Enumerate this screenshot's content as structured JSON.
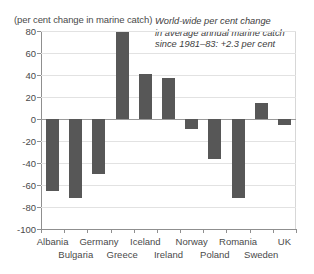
{
  "chart_data": {
    "type": "bar",
    "title": "",
    "subtitle": "",
    "axis_caption": "(per cent change in marine catch)",
    "xlabel": "",
    "ylabel": "",
    "ylim": [
      -100,
      80
    ],
    "yticks": [
      80,
      60,
      40,
      20,
      0,
      -20,
      -40,
      -60,
      -80,
      -100
    ],
    "ytick_labels": [
      "80",
      "60",
      "40",
      "20",
      "0",
      "-20",
      "-40",
      "-60",
      "-80",
      "-100"
    ],
    "grid": true,
    "legend": "none",
    "categories": [
      "Albania",
      "Bulgaria",
      "Germany",
      "Greece",
      "Iceland",
      "Ireland",
      "Norway",
      "Poland",
      "Romania",
      "Sweden",
      "UK"
    ],
    "values": [
      -65,
      -72,
      -50,
      79,
      41,
      37,
      -9,
      -36,
      -72,
      15,
      -5
    ],
    "annotation": {
      "line1": "World-wide per cent change",
      "line2": "in average annual marine catch",
      "line3": "since 1981–83: +2.3 per cent"
    },
    "colors": {
      "bar": "#575757",
      "grid": "#e2e2e2",
      "axis": "#8f8f8f",
      "text": "#4a4a4a",
      "background": "#ffffff"
    }
  }
}
